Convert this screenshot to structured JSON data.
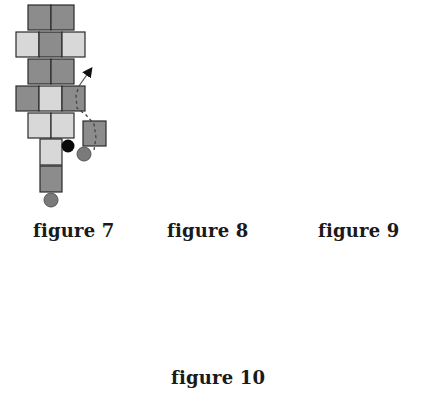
{
  "figures": [
    {
      "id": "figure-7",
      "caption": "figure 7"
    },
    {
      "id": "figure-8",
      "caption": "figure 8"
    },
    {
      "id": "figure-9",
      "caption": "figure 9"
    },
    {
      "id": "figure-10",
      "caption": "figure 10"
    }
  ],
  "colors": {
    "bead_mid_gray": "#8c8c8c",
    "bead_light_gray": "#d8d8d8",
    "bead_dark_gray": "#555555",
    "bead_white": "#ffffff",
    "round_bead_gray": "#7a7a7a",
    "round_bead_black": "#0a0a0a"
  }
}
